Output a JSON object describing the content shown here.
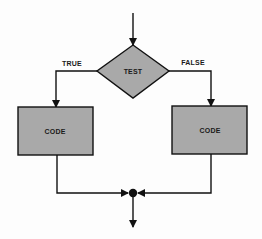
{
  "diagram": {
    "type": "flowchart",
    "title": "",
    "colors": {
      "shape_fill": "#a9a9a9",
      "stroke": "#111111",
      "background": "#fdfdfd"
    },
    "nodes": [
      {
        "id": "test",
        "shape": "diamond",
        "label": "TEST"
      },
      {
        "id": "code_true",
        "shape": "rectangle",
        "label": "CODE"
      },
      {
        "id": "code_false",
        "shape": "rectangle",
        "label": "CODE"
      },
      {
        "id": "join",
        "shape": "junction-dot",
        "label": ""
      }
    ],
    "edges": [
      {
        "from": "entry",
        "to": "test",
        "label": ""
      },
      {
        "from": "test",
        "to": "code_true",
        "label": "TRUE"
      },
      {
        "from": "test",
        "to": "code_false",
        "label": "FALSE"
      },
      {
        "from": "code_true",
        "to": "join",
        "label": ""
      },
      {
        "from": "code_false",
        "to": "join",
        "label": ""
      },
      {
        "from": "join",
        "to": "exit",
        "label": ""
      }
    ],
    "labels": {
      "test": "TEST",
      "true_branch": "TRUE",
      "false_branch": "FALSE",
      "code_left": "CODE",
      "code_right": "CODE"
    }
  }
}
